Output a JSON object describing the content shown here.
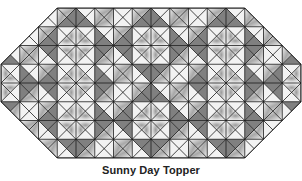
{
  "figure": {
    "caption": "Sunny Day Topper",
    "shape": "elongated octagon",
    "grid": {
      "cols": 16,
      "rows": 8,
      "cell_px": 18.75,
      "origin_x": 1,
      "origin_y": 8,
      "corner_cut_cells": 3
    },
    "colors": {
      "line": "#1a1a1a",
      "dark_fill": "#808080",
      "light_fill": "#f2f2f2",
      "print_shade": "#b8b8b8",
      "background": "#ffffff"
    },
    "block_centers": [
      [
        4,
        2
      ],
      [
        12,
        2
      ],
      [
        8,
        2
      ],
      [
        0,
        4
      ],
      [
        16,
        4
      ],
      [
        4,
        6
      ],
      [
        12,
        6
      ],
      [
        8,
        6
      ],
      [
        4,
        4
      ],
      [
        12,
        4
      ]
    ]
  }
}
